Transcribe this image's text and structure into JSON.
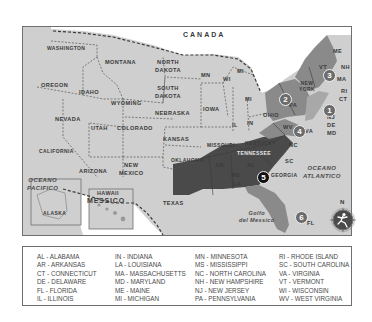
{
  "map": {
    "country_label": "CANADA",
    "mexico_label": "MESSICO",
    "ocean_pacific": [
      "OCEANO",
      "PACIFICO"
    ],
    "ocean_atlantic": [
      "OCEANO",
      "ATLANTICO"
    ],
    "gulf": [
      "Golfo",
      "del Messico"
    ],
    "compass_letter": "N",
    "colors": {
      "land": "#cfcfcf",
      "water": "#ffffff",
      "region_dark": "#4a4a4a",
      "region_mid": "#8a8a8a",
      "region_light": "#a8a8a8",
      "border": "#3a3a3a"
    },
    "states": {
      "washington": "WASHINGTON",
      "oregon": "OREGON",
      "california": "CALIFORNIA",
      "idaho": "IDAHO",
      "nevada": "NEVADA",
      "montana": "MONTANA",
      "wyoming": "WYOMING",
      "utah": "UTAH",
      "colorado": "COLORADO",
      "arizona": "ARIZONA",
      "new_mexico": [
        "NEW",
        "MEXICO"
      ],
      "north_dakota": [
        "NORTH",
        "DAKOTA"
      ],
      "south_dakota": [
        "SOUTH",
        "DAKOTA"
      ],
      "nebraska": "NEBRASKA",
      "kansas": "KANSAS",
      "oklahoma": "OKLAHOMA",
      "texas": "TEXAS",
      "mn": "MN",
      "wi": "WI",
      "mi_upper": "MI",
      "mi_lower": "MI",
      "iowa": "IOWA",
      "il": "IL",
      "in": "IN",
      "ohio": "OHIO",
      "missouri": "MISSOURI",
      "kentucky": "KENTUCKY",
      "tennessee": "TENNESSEE",
      "ar": "AR",
      "la": "LA",
      "ms": "MS",
      "al": "AL",
      "georgia": "GEORGIA",
      "sc": "SC",
      "nc": "NC",
      "fl": "FL",
      "wv": "WV",
      "va": "VA",
      "pa": "PA",
      "new_york": [
        "NEW",
        "YORK"
      ],
      "me": "ME",
      "vt": "VT",
      "nh": "NH",
      "ma": "MA",
      "ri": "RI",
      "ct": "CT",
      "nj": "NJ",
      "de": "DE",
      "md": "MD",
      "alaska": "ALASKA",
      "hawaii": "HAWAII"
    },
    "region_badges": [
      {
        "number": "1",
        "style": "mid"
      },
      {
        "number": "2",
        "style": "mid"
      },
      {
        "number": "3",
        "style": "mid"
      },
      {
        "number": "4",
        "style": "mid"
      },
      {
        "number": "5",
        "style": "dark"
      },
      {
        "number": "6",
        "style": "mid"
      }
    ]
  },
  "legend": {
    "columns": [
      [
        "AL  -  ALABAMA",
        "AR  -  ARKANSAS",
        "CT  -  CONNECTICUT",
        "DE  -  DELAWARE",
        "FL  -  FLORIDA",
        "IL  -  ILLINOIS"
      ],
      [
        "IN  -  INDIANA",
        "LA  -  LOUISIANA",
        "MA  -  MASSACHUSETTS",
        "MD  -  MARYLAND",
        "ME  -  MAINE",
        "MI  -  MICHIGAN"
      ],
      [
        "MN  -  MINNESOTA",
        "MS  -  MISSISSIPPI",
        "NC  -  NORTH CAROLINA",
        "NH  -  NEW HAMPSHIRE",
        "NJ  -  NEW JERSEY",
        "PA  -  PENNSYLVANIA"
      ],
      [
        "RI  -  RHODE ISLAND",
        "SC  -  SOUTH CAROLINA",
        "VA  -  VIRGINIA",
        "VT  -  VERMONT",
        "WI  -  WISCONSIN",
        "WV  -  WEST VIRGINIA"
      ]
    ]
  }
}
